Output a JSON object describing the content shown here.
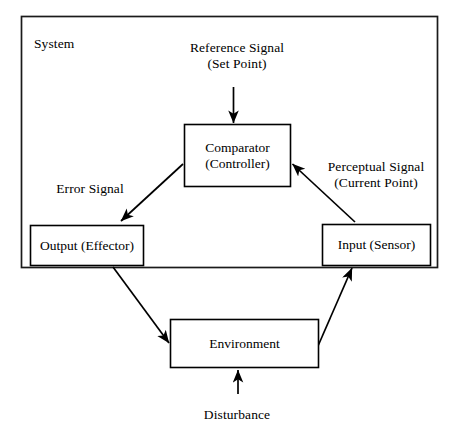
{
  "diagram": {
    "system_label": "System",
    "boxes": {
      "comparator": {
        "line1": "Comparator",
        "line2": "(Controller)"
      },
      "output": {
        "line1": "Output (Effector)"
      },
      "input": {
        "line1": "Input (Sensor)"
      },
      "environment": {
        "line1": "Environment"
      }
    },
    "labels": {
      "reference_signal_line1": "Reference Signal",
      "reference_signal_line2": "(Set Point)",
      "perceptual_signal_line1": "Perceptual Signal",
      "perceptual_signal_line2": "(Current Point)",
      "error_signal": "Error Signal",
      "disturbance": "Disturbance"
    },
    "colors": {
      "stroke": "#000000",
      "outer_stroke": "#1a1a1a",
      "fill": "#ffffff",
      "text": "#000000"
    }
  }
}
